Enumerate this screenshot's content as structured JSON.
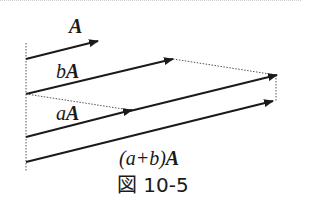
{
  "figure": {
    "caption": "図 10-5",
    "labels": {
      "a_vec_scalar": "",
      "a_vec_name": "A",
      "b_vec_scalar": "b",
      "b_vec_name": "A",
      "aa_vec_scalar": "a",
      "aa_vec_name": "A",
      "sum_vec_scalar": "(a+b)",
      "sum_vec_name": "A"
    },
    "colors": {
      "line": "#1a1a1a",
      "dotted": "#555555"
    }
  }
}
